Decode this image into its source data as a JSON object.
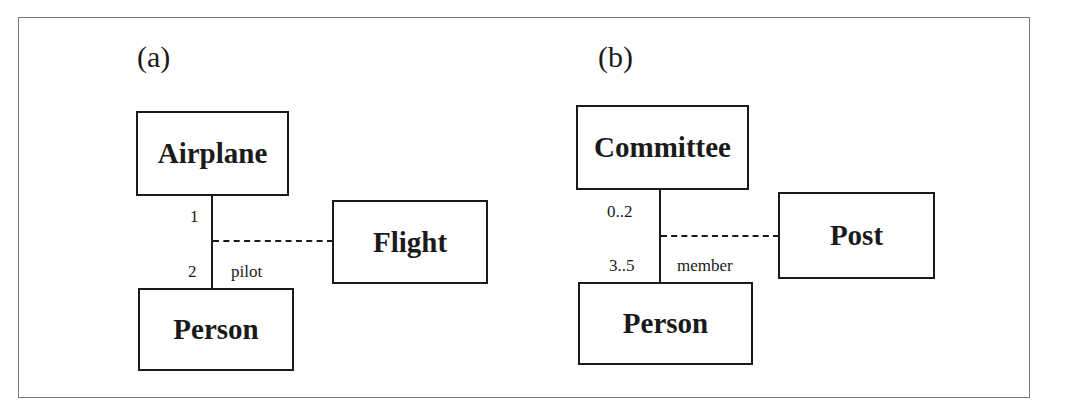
{
  "diagram": {
    "type": "UML association class examples",
    "panels": [
      {
        "label": "(a)",
        "classes": {
          "top": "Airplane",
          "bottom": "Person",
          "association_class": "Flight"
        },
        "association": {
          "top_multiplicity": "1",
          "bottom_multiplicity": "2",
          "role": "pilot"
        }
      },
      {
        "label": "(b)",
        "classes": {
          "top": "Committee",
          "bottom": "Person",
          "association_class": "Post"
        },
        "association": {
          "top_multiplicity": "0..2",
          "bottom_multiplicity": "3..5",
          "role": "member"
        }
      }
    ]
  },
  "colors": {
    "stroke": "#1a1a1a",
    "frame": "#7a7a7a",
    "background": "#ffffff"
  }
}
